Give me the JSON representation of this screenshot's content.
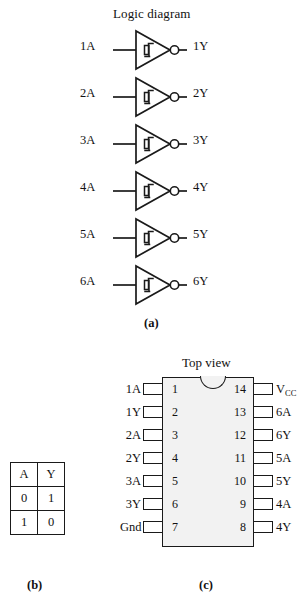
{
  "figure": {
    "logic_diagram": {
      "title": "Logic diagram",
      "gate_type": "schmitt-trigger-inverter",
      "gate_count": 6,
      "gates": [
        {
          "input": "1A",
          "output": "1Y"
        },
        {
          "input": "2A",
          "output": "2Y"
        },
        {
          "input": "3A",
          "output": "3Y"
        },
        {
          "input": "4A",
          "output": "4Y"
        },
        {
          "input": "5A",
          "output": "5Y"
        },
        {
          "input": "6A",
          "output": "6Y"
        }
      ]
    },
    "truth_table": {
      "headers": [
        "A",
        "Y"
      ],
      "rows": [
        [
          "0",
          "1"
        ],
        [
          "1",
          "0"
        ]
      ]
    },
    "pinout": {
      "title": "Top view",
      "package_pins": 14,
      "left_pins": [
        {
          "number": "1",
          "label": "1A"
        },
        {
          "number": "2",
          "label": "1Y"
        },
        {
          "number": "3",
          "label": "2A"
        },
        {
          "number": "4",
          "label": "2Y"
        },
        {
          "number": "5",
          "label": "3A"
        },
        {
          "number": "6",
          "label": "3Y"
        },
        {
          "number": "7",
          "label": "Gnd"
        }
      ],
      "right_pins": [
        {
          "number": "14",
          "label": "V",
          "sub": "CC"
        },
        {
          "number": "13",
          "label": "6A",
          "sub": ""
        },
        {
          "number": "12",
          "label": "6Y",
          "sub": ""
        },
        {
          "number": "11",
          "label": "5A",
          "sub": ""
        },
        {
          "number": "10",
          "label": "5Y",
          "sub": ""
        },
        {
          "number": "9",
          "label": "4A",
          "sub": ""
        },
        {
          "number": "8",
          "label": "4Y",
          "sub": ""
        }
      ]
    },
    "captions": {
      "a": "(a)",
      "b": "(b)",
      "c": "(c)"
    },
    "colors": {
      "ink": "#1a1a1a",
      "ic_fill": "#f2f2f2",
      "background": "#ffffff"
    }
  }
}
